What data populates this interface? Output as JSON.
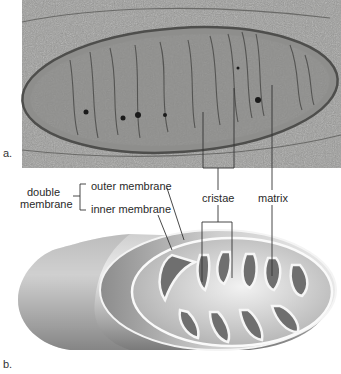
{
  "figure": {
    "panel_a": {
      "letter": "a.",
      "description": "electron micrograph of a mitochondrion"
    },
    "panel_b": {
      "letter": "b.",
      "description": "cutaway drawing of a mitochondrion"
    },
    "labels": {
      "double_membrane_line1": "double",
      "double_membrane_line2": "membrane",
      "outer_membrane": "outer membrane",
      "inner_membrane": "inner membrane",
      "cristae": "cristae",
      "matrix": "matrix"
    },
    "colors": {
      "micrograph_bg": "#9a9a98",
      "micrograph_dark": "#5a5a58",
      "drawing_light": "#e6e6e6",
      "drawing_shadow": "#8a8a8a",
      "leader_line": "#333333"
    }
  }
}
